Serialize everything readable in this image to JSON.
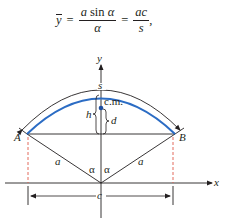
{
  "formula": {
    "lhs": "y",
    "equals": "=",
    "frac1_num_a": "a",
    "frac1_num_sin": "sin",
    "frac1_num_alpha": "α",
    "frac1_den": "α",
    "frac2_num": "ac",
    "frac2_den": "s",
    "trailing": ","
  },
  "diagram": {
    "axis_labels": {
      "x": "x",
      "y": "y"
    },
    "point_labels": {
      "A": "A",
      "B": "B"
    },
    "arc_label": "s",
    "center_of_mass_label": "c.m.",
    "h_label": "h",
    "d_label": "d",
    "radius_labels": [
      "a",
      "a"
    ],
    "angle_labels": [
      "α",
      "α"
    ],
    "chord_label": "c",
    "colors": {
      "line": "#231f20",
      "wire_arc": "#2b6cc4",
      "center_of_mass_dot": "#1f4fa0",
      "dashed_guides": "#e05a4a"
    }
  }
}
